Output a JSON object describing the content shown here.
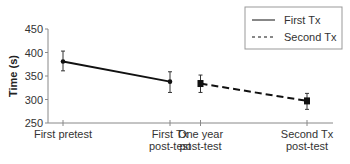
{
  "chart_data": {
    "type": "line",
    "title": "",
    "xlabel": "",
    "ylabel": "Time (s)",
    "ylim": [
      250,
      450
    ],
    "yticks": [
      250,
      300,
      350,
      400,
      450
    ],
    "grid": false,
    "legend_position": "top-right",
    "categories": [
      [
        "First pretest"
      ],
      [
        "First Tx",
        "post-test"
      ],
      [
        "One year",
        "post-test"
      ],
      [
        "Second Tx",
        "post-test"
      ]
    ],
    "series": [
      {
        "name": "First Tx",
        "style": "solid",
        "marker": "circle",
        "points": [
          {
            "category": "First pretest",
            "value": 381,
            "error_low": 361,
            "error_high": 403
          },
          {
            "category": "First Tx post-test",
            "value": 338,
            "error_low": 315,
            "error_high": 359
          }
        ]
      },
      {
        "name": "Second Tx",
        "style": "dashed",
        "marker": "square",
        "points": [
          {
            "category": "One year post-test",
            "value": 334,
            "error_low": 315,
            "error_high": 352
          },
          {
            "category": "Second Tx post-test",
            "value": 297,
            "error_low": 279,
            "error_high": 313
          }
        ]
      }
    ]
  },
  "legend": {
    "items": [
      {
        "label": "First Tx",
        "style": "solid"
      },
      {
        "label": "Second Tx",
        "style": "dashed"
      }
    ]
  },
  "colors": {
    "line": "#111111",
    "axis": "#888888",
    "text": "#333333"
  }
}
